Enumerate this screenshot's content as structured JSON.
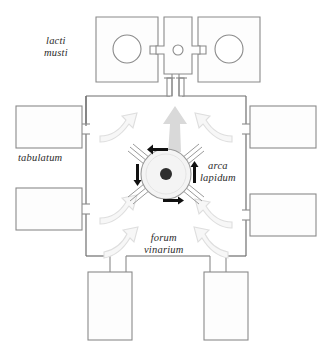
{
  "figure": {
    "kind": "architectural-plan",
    "palette": {
      "wall_stroke": "#8a8a8a",
      "wall_stroke_dark": "#6f6f6f",
      "room_fill": "#fdfdfd",
      "courtyard_fill": "#ffffff",
      "flow_arrow_fill": "#f2f2f2",
      "flow_arrow_stroke": "#dcdcdc",
      "big_arrow_fill": "#d9d9d9",
      "press_circle_fill": "#f4f4f4",
      "press_hub_fill": "#2e2e2e",
      "motion_arrow": "#111111",
      "label_text": "#2b2b2b",
      "background": "#ffffff"
    }
  },
  "labels": {
    "lacti_musti": "lacti\nmusti",
    "lacti_musti_line1": "lacti",
    "lacti_musti_line2": "musti",
    "tabulatum": "tabulatum",
    "arca_lapidum_line1": "arca",
    "arca_lapidum_line2": "lapidum",
    "forum_vinarium_line1": "forum",
    "forum_vinarium_line2": "vinarium"
  },
  "spaces": {
    "courtyard": {
      "name": "forum vinarium",
      "shape": "square",
      "x": 86,
      "y": 96,
      "width": 160,
      "height": 160
    },
    "vat_rooms": [
      {
        "name": "lacus-west",
        "x": 96,
        "y": 17,
        "width": 62,
        "height": 65,
        "basin": {
          "cx": 127,
          "cy": 48,
          "r": 14
        }
      },
      {
        "name": "lacus-east",
        "x": 198,
        "y": 17,
        "width": 62,
        "height": 65,
        "basin": {
          "cx": 229,
          "cy": 48,
          "r": 14
        }
      },
      {
        "name": "lacus-central",
        "x": 164,
        "y": 17,
        "width": 28,
        "height": 65,
        "basin": {
          "cx": 178,
          "cy": 50,
          "r": 5
        }
      }
    ],
    "side_rooms": [
      {
        "name": "tabulatum-west-upper",
        "x": 16,
        "y": 106,
        "width": 66,
        "height": 42
      },
      {
        "name": "tabulatum-west-lower",
        "x": 16,
        "y": 188,
        "width": 66,
        "height": 42
      },
      {
        "name": "tabulatum-east-upper",
        "x": 250,
        "y": 106,
        "width": 66,
        "height": 42
      },
      {
        "name": "tabulatum-east-lower",
        "x": 250,
        "y": 194,
        "width": 66,
        "height": 42
      },
      {
        "name": "cella-south-west",
        "x": 88,
        "y": 272,
        "width": 44,
        "height": 68
      },
      {
        "name": "cella-south-east",
        "x": 204,
        "y": 272,
        "width": 44,
        "height": 68
      }
    ]
  },
  "press": {
    "name": "arca lapidum",
    "circle": {
      "cx": 166,
      "cy": 174,
      "r": 25
    },
    "hub": {
      "cx": 166,
      "cy": 174,
      "r": 6
    },
    "beam_count": 4,
    "rotation_arrows": [
      {
        "position": "top",
        "direction": "left"
      },
      {
        "position": "right",
        "direction": "up"
      },
      {
        "position": "bottom",
        "direction": "right"
      },
      {
        "position": "left",
        "direction": "down"
      }
    ]
  },
  "flow": {
    "main_arrow": {
      "name": "must-outflow-arrow",
      "direction": "up",
      "from": "press",
      "to": "lacus-central"
    },
    "entry_arrows": [
      {
        "name": "flow-arrow-nw",
        "direction": "inward-right"
      },
      {
        "name": "flow-arrow-ne",
        "direction": "inward-left"
      },
      {
        "name": "flow-arrow-w",
        "direction": "inward-right-up"
      },
      {
        "name": "flow-arrow-e",
        "direction": "inward-left-up"
      },
      {
        "name": "flow-arrow-sw",
        "direction": "inward-up-right"
      },
      {
        "name": "flow-arrow-se",
        "direction": "inward-up-left"
      }
    ]
  },
  "gateway": {
    "name": "north-gateway",
    "x": 164,
    "y": 80,
    "width": 24,
    "height": 18
  }
}
